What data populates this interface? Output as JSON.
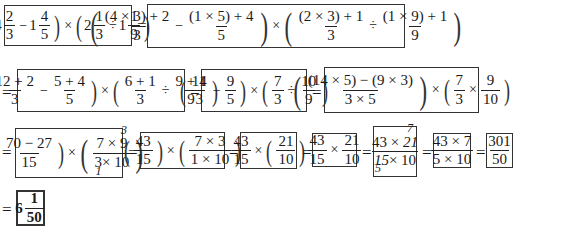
{
  "problem": {
    "expression": "(4 2/3 - 1 4/5) × (2 1/3 ÷ 1 1/9)",
    "a_whole": "4",
    "a_num": "2",
    "a_den": "3",
    "b_whole": "1",
    "b_num": "4",
    "b_den": "5",
    "c_whole": "2",
    "c_num": "1",
    "c_den": "3",
    "d_whole": "1",
    "d_num": "1",
    "d_den": "9"
  },
  "steps": [
    {
      "id": "step1",
      "text": "(((4×3)+2)/3 − ((1×5)+4)/5) × (((2×3)+1)/3 ÷ ((1×9)+1)/9)",
      "f1_num": "(4 × 3) + 2",
      "f1_den": "3",
      "f2_num": "(1 × 5) + 4",
      "f2_den": "5",
      "f3_num": "(2 × 3) + 1",
      "f3_den": "3",
      "f4_num": "(1 × 9) + 1",
      "f4_den": "9"
    },
    {
      "id": "step2",
      "text": "((12+2)/3 − (5+4)/5) × ((6+1)/3 ÷ (9+1)/9)",
      "f1_num": "12 + 2",
      "f1_den": "3",
      "f2_num": "5 + 4",
      "f2_den": "5",
      "f3_num": "6 + 1",
      "f3_den": "3",
      "f4_num": "9 + 1",
      "f4_den": "9"
    },
    {
      "id": "step3",
      "text": "(14/3 − 9/5) × (7/3 ÷ 10/9)",
      "f1_num": "14",
      "f1_den": "3",
      "f2_num": "9",
      "f2_den": "5",
      "f3_num": "7",
      "f3_den": "3",
      "f4_num": "10",
      "f4_den": "9"
    },
    {
      "id": "step4",
      "text": "(((14×5)−(9×3))/(3×5)) × (7/3 × 9/10)",
      "f1_num": "(14 × 5) − (9 × 3)",
      "f1_den": "3 × 5",
      "f2_num": "7",
      "f2_den": "3",
      "f3_num": "9",
      "f3_den": "10"
    },
    {
      "id": "step5",
      "text": "((70−27)/15) × ((7×9)/(3×10)) with 9→3, 3→1 cancelled",
      "f1_num": "70 − 27",
      "f1_den": "15",
      "f2_num_a": "7 ×",
      "f2_num_b": "9",
      "f2_num_cancel": "3",
      "f2_den_a": "3",
      "f2_den_b": "× 10",
      "f2_den_cancel": "1"
    },
    {
      "id": "step6",
      "text": "(43/15) × ((7×3)/(1×10))",
      "f1_num": "43",
      "f1_den": "15",
      "f2_num": "7 × 3",
      "f2_den": "1 × 10"
    },
    {
      "id": "step7",
      "text": "43/15 × (21/10)",
      "f1_num": "43",
      "f1_den": "15",
      "f2_num": "21",
      "f2_den": "10"
    },
    {
      "id": "step8",
      "text": "43/15 × 21/10",
      "f1_num": "43",
      "f1_den": "15",
      "f2_num": "21",
      "f2_den": "10"
    },
    {
      "id": "step9",
      "text": "(43 × 21)/(15 × 10) with 21→7, 15→5 cancelled",
      "num_a": "43 ×",
      "num_b": "21",
      "num_cancel": "7",
      "den_a": "15",
      "den_b": "× 10",
      "den_cancel": "5"
    },
    {
      "id": "step10",
      "text": "(43 × 7)/(5 × 10)",
      "num": "43 × 7",
      "den": "5 × 10"
    },
    {
      "id": "step11",
      "text": "301/50",
      "num": "301",
      "den": "50"
    },
    {
      "id": "answer",
      "text": "6 1/50",
      "whole": "6",
      "num": "1",
      "den": "50"
    }
  ],
  "symbols": {
    "equals": "=",
    "minus": "−",
    "times": "×",
    "divide": "÷",
    "lparen": "(",
    "rparen": ")"
  }
}
